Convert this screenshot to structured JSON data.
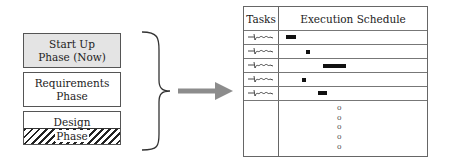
{
  "phases": [
    {
      "id": "startup",
      "lines": [
        "Start Up",
        "Phase (Now)"
      ],
      "fill": "#e4e4e4",
      "pattern": "none"
    },
    {
      "id": "requirements",
      "lines": [
        "Requirements",
        "Phase"
      ],
      "fill": "#ffffff",
      "pattern": "none"
    },
    {
      "id": "design",
      "lines": [
        "Design",
        "Phase"
      ],
      "fill": "#ffffff",
      "pattern": "hatched-bottom-half"
    }
  ],
  "connector": {
    "brace": "right-curly-brace",
    "arrow": "right-arrow",
    "arrow_color": "#8c8c8c"
  },
  "table": {
    "headers": {
      "tasks": "Tasks",
      "schedule": "Execution Schedule"
    },
    "rows": [
      {
        "task": "~squiggle~",
        "bar_start_px": 42,
        "bar_width_px": 10
      },
      {
        "task": "~squiggle~",
        "bar_start_px": 62,
        "bar_width_px": 4
      },
      {
        "task": "~squiggle~",
        "bar_start_px": 79,
        "bar_width_px": 23
      },
      {
        "task": "~squiggle~",
        "bar_start_px": 58,
        "bar_width_px": 4
      },
      {
        "task": "~squiggle~",
        "bar_start_px": 74,
        "bar_width_px": 9
      }
    ],
    "continuation": [
      "o",
      "o",
      "o",
      "o",
      "o"
    ]
  }
}
